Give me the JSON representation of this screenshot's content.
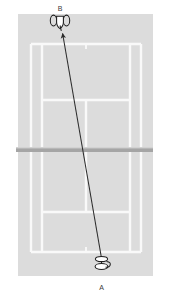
{
  "diagram": {
    "type": "tennis-court-top-view",
    "colors": {
      "background": "#ffffff",
      "court_surface": "#dcdcdc",
      "court_lines": "#f7f7f7",
      "net": "#a8a8a8",
      "net_top_edge": "#cfcfcf",
      "arrow": "#2b2b2b",
      "player_outline": "#1f1f1f",
      "label_text": "#3a3a3a"
    },
    "court": {
      "name": "tennis-court",
      "x": 18,
      "y": 14,
      "width": 135,
      "height": 262,
      "lines": {
        "top_baseline_y": 44,
        "bottom_baseline_y": 252,
        "left_doubles_sideline_x": 31,
        "right_doubles_sideline_x": 141,
        "left_singles_sideline_x": 42,
        "right_singles_sideline_x": 130,
        "top_service_line_y": 100,
        "bottom_service_line_y": 212,
        "center_service_line_x": 86,
        "net_y": 150
      }
    },
    "net": {
      "label": "net",
      "x": 16,
      "y": 147,
      "width": 137,
      "height": 5
    },
    "players": [
      {
        "id": "A",
        "label": "A",
        "role": "hitting-player",
        "x": 102,
        "y": 264,
        "label_x": 102,
        "label_y": 288,
        "position": "bottom-baseline"
      },
      {
        "id": "B",
        "label": "B",
        "role": "receiving-player",
        "x": 60,
        "y": 21,
        "label_x": 60,
        "label_y": 9,
        "position": "top-baseline"
      }
    ],
    "shot_arrow": {
      "label": "shot-path-A-to-B",
      "from_x": 102,
      "from_y": 261,
      "to_x": 62,
      "to_y": 32,
      "direction": "A to B",
      "stroke_width": 1
    }
  }
}
